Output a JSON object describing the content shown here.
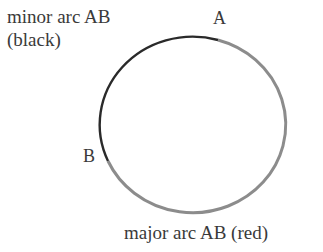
{
  "diagram": {
    "type": "circle-arcs",
    "labels": {
      "minor_line1": "minor arc AB",
      "minor_line2": "(black)",
      "point_a": "A",
      "point_b": "B",
      "major": "major arc AB (red)"
    },
    "circle": {
      "cx": 196,
      "cy": 127,
      "rx": 93,
      "ry": 88
    },
    "points": {
      "A": {
        "x": 218,
        "y": 40
      },
      "B": {
        "x": 108,
        "y": 161
      }
    },
    "colors": {
      "minor_arc": "#2a2a2a",
      "major_arc": "#8c8c8c",
      "text": "#3a3a3a"
    }
  }
}
